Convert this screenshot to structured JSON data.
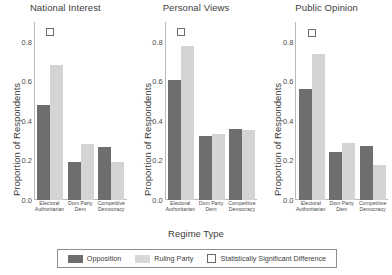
{
  "chart_data": {
    "type": "bar",
    "title": "",
    "xlabel": "Regime Type",
    "ylabel": "Proportion of Respondents",
    "ylim": [
      0.0,
      0.9
    ],
    "yticks": [
      "0.0",
      "0.2",
      "0.4",
      "0.6",
      "0.8"
    ],
    "ytick_values": [
      0.0,
      0.2,
      0.4,
      0.6,
      0.8
    ],
    "grid": false,
    "legend_position": "bottom",
    "categories": [
      "Electoral Authoritarian",
      "Dom Party Dem",
      "Competitive Democracy"
    ],
    "category_lines": [
      [
        "Electoral",
        "Authoritarian"
      ],
      [
        "Dom Party",
        "Dem"
      ],
      [
        "Competitive",
        "Democracy"
      ]
    ],
    "series_names": [
      "Opposition",
      "Ruling Party"
    ],
    "colors": {
      "opposition": "#6e6e6e",
      "ruling_party": "#d4d4d4",
      "significance_marker": "#ffffff",
      "axis": "#b9b9b9",
      "text": "#3d3d3d"
    },
    "panels": [
      {
        "title": "National Interest",
        "series": [
          {
            "name": "Opposition",
            "values": [
              0.48,
              0.19,
              0.27
            ]
          },
          {
            "name": "Ruling Party",
            "values": [
              0.685,
              0.285,
              0.19
            ]
          }
        ],
        "significance": [
          {
            "category": "Electoral Authoritarian",
            "value": 0.85,
            "significant": true
          },
          {
            "category": "Dom Party Dem",
            "significant": false
          },
          {
            "category": "Competitive Democracy",
            "significant": false
          }
        ]
      },
      {
        "title": "Personal Views",
        "series": [
          {
            "name": "Opposition",
            "values": [
              0.605,
              0.325,
              0.36
            ]
          },
          {
            "name": "Ruling Party",
            "values": [
              0.78,
              0.335,
              0.355
            ]
          }
        ],
        "significance": [
          {
            "category": "Electoral Authoritarian",
            "value": 0.85,
            "significant": true
          },
          {
            "category": "Dom Party Dem",
            "significant": false
          },
          {
            "category": "Competitive Democracy",
            "significant": false
          }
        ]
      },
      {
        "title": "Public Opinion",
        "series": [
          {
            "name": "Opposition",
            "values": [
              0.56,
              0.245,
              0.275
            ]
          },
          {
            "name": "Ruling Party",
            "values": [
              0.74,
              0.29,
              0.175
            ]
          }
        ],
        "significance": [
          {
            "category": "Electoral Authoritarian",
            "value": 0.845,
            "significant": true
          },
          {
            "category": "Dom Party Dem",
            "significant": false
          },
          {
            "category": "Competitive Democracy",
            "significant": false
          }
        ]
      }
    ],
    "legend": [
      {
        "label": "Opposition",
        "marker": "filled-dark-swatch"
      },
      {
        "label": "Ruling Party",
        "marker": "filled-light-swatch"
      },
      {
        "label": "Statistically Significant Difference",
        "marker": "open-square"
      }
    ]
  }
}
